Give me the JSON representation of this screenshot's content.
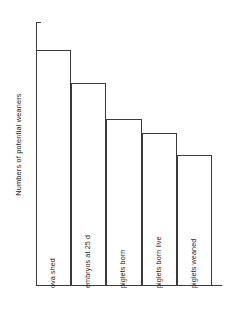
{
  "chart_data": {
    "type": "bar",
    "title": "",
    "subtitle": "",
    "xlabel": "",
    "ylabel": "Numbers of potential weaners",
    "categories": [
      "ova shed",
      "embryos at 25 d",
      "piglets born",
      "piglets born live",
      "piglets weaned"
    ],
    "values": [
      16.1,
      13.8,
      11.35,
      10.4,
      8.9
    ],
    "ylim": [
      0,
      18
    ],
    "ytick_step": 2,
    "ytick_labels": [
      "0",
      "2",
      "4",
      "6",
      "8",
      "10",
      "12",
      "14",
      "16",
      "18"
    ],
    "grid": false,
    "legend": null,
    "legend_position": "none",
    "bar_fill_color": "#ffffff",
    "bar_edge_color": "#3a3a3a",
    "axis_color": "#3a3a3a",
    "label_orientation": "vertical",
    "labels_inside_bars": true,
    "annotations": []
  },
  "axis": {
    "y_title": "Numbers of potential weaners",
    "ticks": [
      {
        "value": 18,
        "label": "18"
      },
      {
        "value": 16,
        "label": "16"
      },
      {
        "value": 14,
        "label": "14"
      },
      {
        "value": 12,
        "label": "12"
      },
      {
        "value": 10,
        "label": "10"
      },
      {
        "value": 8,
        "label": "8"
      },
      {
        "value": 6,
        "label": "6"
      },
      {
        "value": 4,
        "label": "4"
      },
      {
        "value": 2,
        "label": "2"
      },
      {
        "value": 0,
        "label": "0"
      }
    ]
  },
  "bars": [
    {
      "label": "ova shed",
      "value": 16.1
    },
    {
      "label": "embryos at 25 d",
      "value": 13.8
    },
    {
      "label": "piglets born",
      "value": 11.35
    },
    {
      "label": "piglets born live",
      "value": 10.4
    },
    {
      "label": "piglets weaned",
      "value": 8.9
    }
  ]
}
